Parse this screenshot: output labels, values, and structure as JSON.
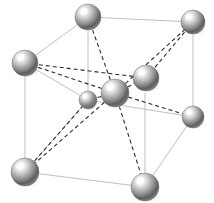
{
  "figure": {
    "caption": "",
    "background_color": "#ffffff",
    "width": 214,
    "height": 203
  },
  "style": {
    "cell_edge_color": "#b8b8b8",
    "cell_edge_width": 0.9,
    "bond_color": "#2b2b2b",
    "bond_width": 1.1,
    "bond_dash": "4 3",
    "sphere_highlight": "#ffffff",
    "sphere_midtone": "#c9c9c9",
    "sphere_shadow": "#4a4a4a",
    "sphere_rim": "#6e6e6e",
    "shadow_color": "#d6d6d6"
  },
  "chart_data": {
    "type": "scatter",
    "xlabel": "",
    "ylabel": "",
    "grid": false,
    "legend": "none",
    "atoms": [
      {
        "id": "corner-top-back",
        "label": "corner atom top back",
        "x": 88,
        "y": 17,
        "r": 13,
        "role": "corner"
      },
      {
        "id": "corner-top-right",
        "label": "corner atom top right",
        "x": 193,
        "y": 22,
        "r": 12,
        "role": "corner"
      },
      {
        "id": "corner-top-left",
        "label": "corner atom top left",
        "x": 25,
        "y": 63,
        "r": 13,
        "role": "corner"
      },
      {
        "id": "face-upper-right",
        "label": "interior atom upper right",
        "x": 146,
        "y": 78,
        "r": 13,
        "role": "interior"
      },
      {
        "id": "center-body",
        "label": "body center atom",
        "x": 115,
        "y": 93,
        "r": 14,
        "role": "center"
      },
      {
        "id": "corner-mid-right",
        "label": "corner atom middle right",
        "x": 193,
        "y": 117,
        "r": 11,
        "role": "corner"
      },
      {
        "id": "interior-small-left",
        "label": "interior atom lower left",
        "x": 88,
        "y": 100,
        "r": 9,
        "role": "interior"
      },
      {
        "id": "corner-bottom-left",
        "label": "corner atom bottom left",
        "x": 25,
        "y": 172,
        "r": 14,
        "role": "corner"
      },
      {
        "id": "corner-bottom-front",
        "label": "corner atom bottom front",
        "x": 145,
        "y": 187,
        "r": 14,
        "role": "corner"
      }
    ],
    "cell_edges": [
      {
        "from": [
          88,
          17
        ],
        "to": [
          193,
          22
        ]
      },
      {
        "from": [
          88,
          17
        ],
        "to": [
          25,
          63
        ]
      },
      {
        "from": [
          88,
          17
        ],
        "to": [
          88,
          100
        ]
      },
      {
        "from": [
          25,
          63
        ],
        "to": [
          25,
          172
        ]
      },
      {
        "from": [
          25,
          63
        ],
        "to": [
          88,
          100
        ]
      },
      {
        "from": [
          193,
          22
        ],
        "to": [
          193,
          117
        ]
      },
      {
        "from": [
          88,
          100
        ],
        "to": [
          193,
          117
        ]
      },
      {
        "from": [
          25,
          172
        ],
        "to": [
          145,
          187
        ]
      },
      {
        "from": [
          145,
          187
        ],
        "to": [
          193,
          117
        ]
      },
      {
        "from": [
          145,
          187
        ],
        "to": [
          145,
          93
        ]
      },
      {
        "from": [
          88,
          100
        ],
        "to": [
          25,
          172
        ]
      }
    ],
    "bonds": [
      {
        "from": [
          115,
          93
        ],
        "to": [
          88,
          17
        ],
        "style": "dashed"
      },
      {
        "from": [
          115,
          93
        ],
        "to": [
          193,
          22
        ],
        "style": "dashed"
      },
      {
        "from": [
          115,
          93
        ],
        "to": [
          25,
          63
        ],
        "style": "dashed"
      },
      {
        "from": [
          115,
          93
        ],
        "to": [
          146,
          78
        ],
        "style": "dashed"
      },
      {
        "from": [
          115,
          93
        ],
        "to": [
          193,
          117
        ],
        "style": "dashed"
      },
      {
        "from": [
          115,
          93
        ],
        "to": [
          88,
          100
        ],
        "style": "dashed"
      },
      {
        "from": [
          115,
          93
        ],
        "to": [
          25,
          172
        ],
        "style": "dashed"
      },
      {
        "from": [
          115,
          93
        ],
        "to": [
          145,
          187
        ],
        "style": "dashed"
      },
      {
        "from": [
          88,
          100
        ],
        "to": [
          25,
          172
        ],
        "style": "dashed"
      },
      {
        "from": [
          146,
          78
        ],
        "to": [
          193,
          22
        ],
        "style": "dashed"
      },
      {
        "from": [
          25,
          63
        ],
        "to": [
          146,
          78
        ],
        "style": "dashed"
      }
    ]
  }
}
